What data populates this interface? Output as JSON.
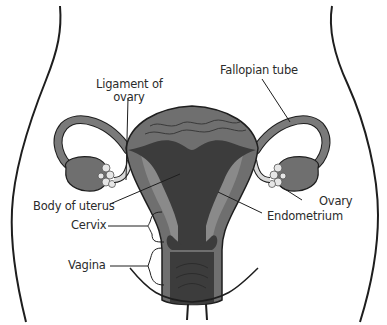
{
  "diagram": {
    "labels": {
      "ligament_line1": "Ligament of",
      "ligament_line2": "ovary",
      "fallopian_tube": "Fallopian tube",
      "body_of_uterus": "Body of uterus",
      "cervix": "Cervix",
      "vagina": "Vagina",
      "ovary": "Ovary",
      "endometrium": "Endometrium"
    },
    "colors": {
      "background": "#ffffff",
      "outline": "#1e1e1e",
      "uterus_wall": "#6f6f6f",
      "uterus_inner": "#3c3c3c",
      "endometrium": "#8a8a8a",
      "ovary_fimbriae": "#e6e6e6",
      "ligament": "#d8d8d8",
      "label_text": "#2b2b2b"
    }
  }
}
